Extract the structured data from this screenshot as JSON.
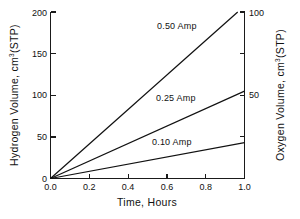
{
  "chart_data": {
    "type": "line",
    "title": "",
    "xlabel": "Time,  Hours",
    "ylabel": "Hydrogen Volume,  cm",
    "ylabel_sup": "3",
    "ylabel_tail": "(STP)",
    "y2label": "Oxygen Volume,  cm",
    "y2label_sup": "3",
    "y2label_tail": "(STP)",
    "xlim": [
      0,
      1.0
    ],
    "ylim": [
      0,
      200
    ],
    "y2lim": [
      0,
      100
    ],
    "grid": false,
    "legend_position": "inline-annotations",
    "xticks": [
      0.0,
      0.2,
      0.4,
      0.6,
      0.8,
      1.0
    ],
    "xtick_labels": [
      "0.0",
      "0.2",
      "0.4",
      "0.6",
      "0.8",
      "1.0"
    ],
    "yticks": [
      0,
      50,
      100,
      150,
      200
    ],
    "ytick_labels": [
      "0",
      "50",
      "100",
      "150",
      "200"
    ],
    "y2ticks": [
      0,
      25,
      50,
      75,
      100
    ],
    "y2tick_labels": [
      "",
      "",
      "50",
      "",
      "100"
    ],
    "series": [
      {
        "name": "0.50 Amp",
        "label": "0.50  Amp",
        "x": [
          0.0,
          0.965
        ],
        "values": [
          0,
          200
        ],
        "label_x": 0.56,
        "label_y": 182,
        "color": "#111111"
      },
      {
        "name": "0.25 Amp",
        "label": "0.25  Amp",
        "x": [
          0.0,
          1.0
        ],
        "values": [
          0,
          105
        ],
        "label_x": 0.55,
        "label_y": 98,
        "color": "#111111"
      },
      {
        "name": "0.10 Amp",
        "label": "0.10  Amp",
        "x": [
          0.0,
          1.0
        ],
        "values": [
          0,
          43
        ],
        "label_x": 0.53,
        "label_y": 50,
        "color": "#111111"
      }
    ]
  }
}
